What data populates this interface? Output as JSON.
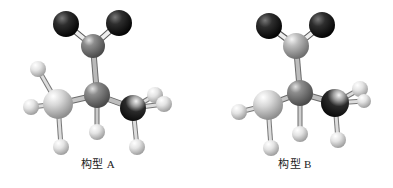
{
  "figure": {
    "background_color": "#ffffff",
    "width": 393,
    "height": 188,
    "type": "ball-and-stick-molecular-model"
  },
  "palette": {
    "oxygen_dark": "#1a1a1a",
    "oxygen_highlight": "#6f6f6f",
    "carbon_gray": "#6e6e6e",
    "carbon_gray_highlight": "#d2d2d2",
    "carbon_light": "#c9c9c9",
    "carbon_light_highlight": "#ffffff",
    "carbon_dark": "#2a2a2a",
    "carbon_dark_highlight": "#e8e8e8",
    "hydrogen_white": "#e6e6e6",
    "hydrogen_highlight": "#ffffff",
    "bond_color": "#9a9a9a",
    "bond_outline": "#4a4a4a",
    "label_color": "#1b1b1b"
  },
  "models": [
    {
      "id": "conformer-a",
      "caption": "构型 A",
      "atoms": [
        {
          "name": "oxygen-left",
          "element": "O",
          "style": "dark",
          "cx": 66,
          "cy": 24,
          "r": 13
        },
        {
          "name": "oxygen-right",
          "element": "O",
          "style": "dark",
          "cx": 119,
          "cy": 23,
          "r": 13
        },
        {
          "name": "carboxyl-carbon",
          "element": "C",
          "style": "gray",
          "cx": 93,
          "cy": 46,
          "r": 12
        },
        {
          "name": "central-carbon",
          "element": "C",
          "style": "gray",
          "cx": 97,
          "cy": 95,
          "r": 13
        },
        {
          "name": "methyl-carbon-left",
          "element": "C",
          "style": "light",
          "cx": 58,
          "cy": 104,
          "r": 15
        },
        {
          "name": "methyl-carbon-right",
          "element": "C",
          "style": "dark-carbon",
          "cx": 133,
          "cy": 108,
          "r": 13
        },
        {
          "name": "hydrogen-central",
          "element": "H",
          "style": "white",
          "cx": 97,
          "cy": 132,
          "r": 8
        },
        {
          "name": "hydrogen-left-upper",
          "element": "H",
          "style": "white",
          "cx": 38,
          "cy": 69,
          "r": 8
        },
        {
          "name": "hydrogen-left-side",
          "element": "H",
          "style": "white",
          "cx": 31,
          "cy": 107,
          "r": 8
        },
        {
          "name": "hydrogen-left-lower",
          "element": "H",
          "style": "white",
          "cx": 61,
          "cy": 147,
          "r": 8
        },
        {
          "name": "hydrogen-right-upper",
          "element": "H",
          "style": "white",
          "cx": 155,
          "cy": 95,
          "r": 8
        },
        {
          "name": "hydrogen-right-side",
          "element": "H",
          "style": "white",
          "cx": 164,
          "cy": 104,
          "r": 8
        },
        {
          "name": "hydrogen-right-lower",
          "element": "H",
          "style": "white",
          "cx": 137,
          "cy": 147,
          "r": 8
        }
      ],
      "bonds": [
        {
          "name": "bond-carboxyl-oxygen-left",
          "x1": 93,
          "y1": 46,
          "x2": 66,
          "y2": 24,
          "width": 5
        },
        {
          "name": "bond-carboxyl-oxygen-right",
          "x1": 93,
          "y1": 46,
          "x2": 119,
          "y2": 23,
          "width": 5
        },
        {
          "name": "bond-carboxyl-central",
          "x1": 93,
          "y1": 46,
          "x2": 97,
          "y2": 95,
          "width": 5
        },
        {
          "name": "bond-central-methyl-left",
          "x1": 97,
          "y1": 95,
          "x2": 58,
          "y2": 104,
          "width": 5
        },
        {
          "name": "bond-central-methyl-right",
          "x1": 97,
          "y1": 95,
          "x2": 133,
          "y2": 108,
          "width": 5
        },
        {
          "name": "bond-central-hydrogen",
          "x1": 97,
          "y1": 95,
          "x2": 97,
          "y2": 132,
          "width": 4
        },
        {
          "name": "bond-methyl-left-h1",
          "x1": 58,
          "y1": 104,
          "x2": 38,
          "y2": 69,
          "width": 4
        },
        {
          "name": "bond-methyl-left-h2",
          "x1": 58,
          "y1": 104,
          "x2": 31,
          "y2": 107,
          "width": 4
        },
        {
          "name": "bond-methyl-left-h3",
          "x1": 58,
          "y1": 104,
          "x2": 61,
          "y2": 147,
          "width": 4
        },
        {
          "name": "bond-methyl-right-h1",
          "x1": 133,
          "y1": 108,
          "x2": 155,
          "y2": 95,
          "width": 4
        },
        {
          "name": "bond-methyl-right-h2",
          "x1": 133,
          "y1": 108,
          "x2": 164,
          "y2": 104,
          "width": 4
        },
        {
          "name": "bond-methyl-right-h3",
          "x1": 133,
          "y1": 108,
          "x2": 137,
          "y2": 147,
          "width": 4
        }
      ]
    },
    {
      "id": "conformer-b",
      "caption": "构型 B",
      "atoms": [
        {
          "name": "oxygen-left",
          "element": "O",
          "style": "dark",
          "cx": 72,
          "cy": 26,
          "r": 13
        },
        {
          "name": "oxygen-right",
          "element": "O",
          "style": "dark",
          "cx": 125,
          "cy": 25,
          "r": 13
        },
        {
          "name": "carboxyl-carbon",
          "element": "C",
          "style": "light-gray",
          "cx": 99,
          "cy": 46,
          "r": 13
        },
        {
          "name": "central-carbon",
          "element": "C",
          "style": "gray",
          "cx": 103,
          "cy": 93,
          "r": 13
        },
        {
          "name": "methyl-carbon-left",
          "element": "C",
          "style": "light",
          "cx": 71,
          "cy": 105,
          "r": 15
        },
        {
          "name": "methyl-carbon-right",
          "element": "C",
          "style": "dark-carbon",
          "cx": 138,
          "cy": 103,
          "r": 14
        },
        {
          "name": "hydrogen-left-side",
          "element": "H",
          "style": "white",
          "cx": 42,
          "cy": 112,
          "r": 8
        },
        {
          "name": "hydrogen-left-lower",
          "element": "H",
          "style": "white",
          "cx": 74,
          "cy": 148,
          "r": 8
        },
        {
          "name": "hydrogen-central-lower",
          "element": "H",
          "style": "white",
          "cx": 103,
          "cy": 134,
          "r": 8
        },
        {
          "name": "hydrogen-right-upper",
          "element": "H",
          "style": "white",
          "cx": 163,
          "cy": 89,
          "r": 8
        },
        {
          "name": "hydrogen-right-side",
          "element": "H",
          "style": "white",
          "cx": 167,
          "cy": 101,
          "r": 7
        },
        {
          "name": "hydrogen-right-lower",
          "element": "H",
          "style": "white",
          "cx": 141,
          "cy": 140,
          "r": 8
        }
      ],
      "bonds": [
        {
          "name": "bond-carboxyl-oxygen-left",
          "x1": 99,
          "y1": 46,
          "x2": 72,
          "y2": 26,
          "width": 5
        },
        {
          "name": "bond-carboxyl-oxygen-right",
          "x1": 99,
          "y1": 46,
          "x2": 125,
          "y2": 25,
          "width": 5
        },
        {
          "name": "bond-carboxyl-central",
          "x1": 99,
          "y1": 46,
          "x2": 103,
          "y2": 93,
          "width": 5
        },
        {
          "name": "bond-central-methyl-left",
          "x1": 103,
          "y1": 93,
          "x2": 71,
          "y2": 105,
          "width": 5
        },
        {
          "name": "bond-central-methyl-right",
          "x1": 103,
          "y1": 93,
          "x2": 138,
          "y2": 103,
          "width": 5
        },
        {
          "name": "bond-central-hydrogen",
          "x1": 103,
          "y1": 93,
          "x2": 103,
          "y2": 134,
          "width": 4
        },
        {
          "name": "bond-methyl-left-h1",
          "x1": 71,
          "y1": 105,
          "x2": 42,
          "y2": 112,
          "width": 4
        },
        {
          "name": "bond-methyl-left-h2",
          "x1": 71,
          "y1": 105,
          "x2": 74,
          "y2": 148,
          "width": 4
        },
        {
          "name": "bond-methyl-right-h1",
          "x1": 138,
          "y1": 103,
          "x2": 163,
          "y2": 89,
          "width": 4
        },
        {
          "name": "bond-methyl-right-h2",
          "x1": 138,
          "y1": 103,
          "x2": 167,
          "y2": 101,
          "width": 4
        },
        {
          "name": "bond-methyl-right-h3",
          "x1": 138,
          "y1": 103,
          "x2": 141,
          "y2": 140,
          "width": 4
        }
      ]
    }
  ]
}
